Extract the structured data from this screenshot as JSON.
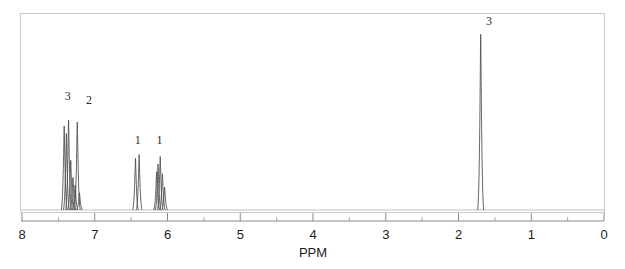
{
  "figure": {
    "kind": "nmr-spectrum",
    "axis_title": "PPM",
    "frame_color": "#c9c9c9",
    "trace_color": "#4a4a4a",
    "baseline_color": "#b8b8b8",
    "label_color": "#2b2b2b"
  },
  "chart_data": {
    "type": "line",
    "title": "",
    "xlabel": "PPM",
    "ylabel": "",
    "xlim": [
      8,
      0
    ],
    "ylim": [
      0,
      1
    ],
    "grid": false,
    "legend": "none",
    "x_major_ticks": [
      8,
      7,
      6,
      5,
      4,
      3,
      2,
      1,
      0
    ],
    "x_major_tick_labels": [
      "8",
      "7",
      "6",
      "5",
      "4",
      "3",
      "2",
      "1",
      "0"
    ],
    "x_minor_ticks": [
      7.5,
      6.5,
      5.5,
      4.5,
      3.5,
      2.5,
      1.5,
      0.5
    ],
    "x_axis_direction": "reversed",
    "peaks": [
      {
        "ppm": 7.42,
        "height": 0.44,
        "width": 0.012,
        "label": ""
      },
      {
        "ppm": 7.39,
        "height": 0.4,
        "width": 0.012,
        "label": ""
      },
      {
        "ppm": 7.36,
        "height": 0.47,
        "width": 0.012,
        "label": ""
      },
      {
        "ppm": 7.33,
        "height": 0.26,
        "width": 0.012,
        "label": ""
      },
      {
        "ppm": 7.3,
        "height": 0.17,
        "width": 0.012,
        "label": ""
      },
      {
        "ppm": 7.27,
        "height": 0.13,
        "width": 0.012,
        "label": ""
      },
      {
        "ppm": 7.24,
        "height": 0.46,
        "width": 0.012,
        "label": ""
      },
      {
        "ppm": 7.21,
        "height": 0.09,
        "width": 0.012,
        "label": ""
      },
      {
        "ppm": 6.44,
        "height": 0.27,
        "width": 0.011,
        "label": ""
      },
      {
        "ppm": 6.39,
        "height": 0.29,
        "width": 0.011,
        "label": ""
      },
      {
        "ppm": 6.15,
        "height": 0.2,
        "width": 0.011,
        "label": ""
      },
      {
        "ppm": 6.13,
        "height": 0.24,
        "width": 0.011,
        "label": ""
      },
      {
        "ppm": 6.1,
        "height": 0.28,
        "width": 0.011,
        "label": ""
      },
      {
        "ppm": 6.07,
        "height": 0.19,
        "width": 0.011,
        "label": ""
      },
      {
        "ppm": 6.04,
        "height": 0.12,
        "width": 0.011,
        "label": ""
      },
      {
        "ppm": 1.695,
        "height": 0.92,
        "width": 0.013,
        "label": ""
      }
    ],
    "integral_labels": [
      {
        "text": "3",
        "ppm": 7.37,
        "y_frac": 0.56
      },
      {
        "text": "2",
        "ppm": 7.08,
        "y_frac": 0.54
      },
      {
        "text": "1",
        "ppm": 6.41,
        "y_frac": 0.33
      },
      {
        "text": "1",
        "ppm": 6.11,
        "y_frac": 0.33
      },
      {
        "text": "3",
        "ppm": 1.58,
        "y_frac": 0.955
      }
    ]
  }
}
